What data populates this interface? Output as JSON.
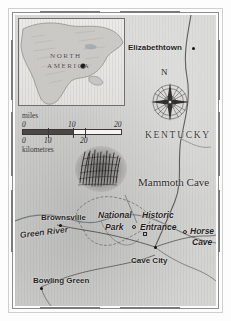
{
  "map": {
    "title": "Mammoth Cave region, Kentucky",
    "region_label": "KENTUCKY",
    "feature_label": "Mammoth Cave",
    "inset": {
      "line1": "NORTH",
      "line2": "AMERICA"
    },
    "compass": {
      "north_label": "N"
    },
    "scale": {
      "miles_caption": "miles",
      "kilometres_caption": "kilometres",
      "miles_ticks": [
        "0",
        "10",
        "20"
      ],
      "km_ticks": [
        "0",
        "10",
        "20"
      ]
    },
    "places": [
      {
        "name": "Elizabethtown",
        "marker": "dot"
      },
      {
        "name": "Brownsville",
        "marker": "dot"
      },
      {
        "name": "Bowling Green",
        "marker": "dot"
      },
      {
        "name": "Cave City",
        "marker": "dot"
      },
      {
        "name": "Horse Cave",
        "marker": "ring"
      },
      {
        "name": "Historic Entrance",
        "marker": "ring"
      },
      {
        "name": "National Park",
        "marker": "none"
      },
      {
        "name": "Green River",
        "marker": "none"
      }
    ],
    "labels": {
      "elizabethtown": "Elizabethtown",
      "brownsville": "Brownsville",
      "bowling_green": "Bowling Green",
      "cave_city": "Cave City",
      "horse_cave_line1": "Horse",
      "horse_cave_line2": "Cave",
      "historic_line1": "Historic",
      "historic_line2": "Entrance",
      "national_line1": "National",
      "national_line2": "Park",
      "green_river": "Green River"
    },
    "colors": {
      "paper": "#d6d6d4",
      "ink": "#1f1d1b",
      "frame": "#8d8d8d",
      "water": "#8f9aa0"
    }
  }
}
